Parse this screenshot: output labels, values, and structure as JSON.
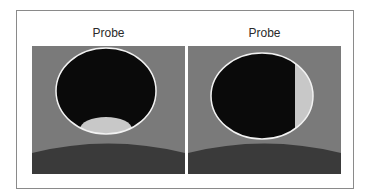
{
  "figure": {
    "panels": [
      {
        "id": "left",
        "title": "Probe",
        "description": "Dark circular probe view with light elliptical region at bottom",
        "colors": {
          "background": "#7a7a7a",
          "ground": "#3a3a3a",
          "probe_interior": "#0a0a0a",
          "probe_outline": "#f2f2f2",
          "highlight": "#c8c8c8"
        }
      },
      {
        "id": "right",
        "title": "Probe",
        "description": "Dark circular probe view with light vertical band on right side",
        "colors": {
          "background": "#7a7a7a",
          "ground": "#3a3a3a",
          "probe_interior": "#0a0a0a",
          "probe_outline": "#f2f2f2",
          "highlight": "#c8c8c8"
        }
      }
    ]
  }
}
